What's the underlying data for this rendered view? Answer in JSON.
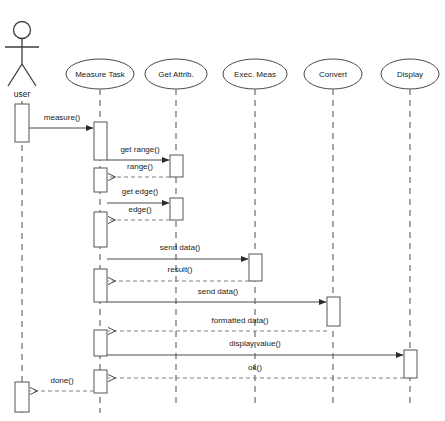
{
  "diagram": {
    "type": "uml-sequence-diagram",
    "title": "",
    "background_color": "#ffffff",
    "line_color": "#4a4a4a",
    "dash_color": "#808080",
    "actor": {
      "label": "user",
      "cx": 22,
      "head_cy": 30,
      "icon": "stick-figure-actor"
    },
    "lifelines": [
      {
        "id": "user",
        "label": "user",
        "x": 22,
        "shape": "actor",
        "head_cy": 30
      },
      {
        "id": "measure_task",
        "label": "Measure Task",
        "x": 100,
        "shape": "ellipse",
        "head_cy": 74
      },
      {
        "id": "get_attrib",
        "label": "Get Attrib.",
        "x": 176,
        "shape": "ellipse",
        "head_cy": 74
      },
      {
        "id": "exec_meas",
        "label": "Exec. Meas",
        "x": 255,
        "shape": "ellipse",
        "head_cy": 74
      },
      {
        "id": "convert",
        "label": "Convert",
        "x": 333,
        "shape": "ellipse",
        "head_cy": 74
      },
      {
        "id": "display",
        "label": "Display",
        "x": 410,
        "shape": "ellipse",
        "head_cy": 74
      }
    ],
    "activations": [
      {
        "lifeline": "user",
        "x": 22,
        "y": 104,
        "w": 14,
        "h": 38
      },
      {
        "lifeline": "user",
        "x": 22,
        "y": 382,
        "w": 14,
        "h": 30
      },
      {
        "lifeline": "measure_task",
        "x": 100,
        "y": 122,
        "w": 13,
        "h": 38
      },
      {
        "lifeline": "measure_task",
        "x": 100,
        "y": 168,
        "w": 13,
        "h": 24
      },
      {
        "lifeline": "measure_task",
        "x": 100,
        "y": 212,
        "w": 13,
        "h": 35
      },
      {
        "lifeline": "measure_task",
        "x": 100,
        "y": 269,
        "w": 13,
        "h": 33
      },
      {
        "lifeline": "measure_task",
        "x": 100,
        "y": 330,
        "w": 13,
        "h": 26
      },
      {
        "lifeline": "measure_task",
        "x": 100,
        "y": 370,
        "w": 13,
        "h": 23
      },
      {
        "lifeline": "get_attrib",
        "x": 176,
        "y": 155,
        "w": 13,
        "h": 22
      },
      {
        "lifeline": "get_attrib",
        "x": 176,
        "y": 198,
        "w": 13,
        "h": 22
      },
      {
        "lifeline": "exec_meas",
        "x": 255,
        "y": 254,
        "w": 13,
        "h": 27
      },
      {
        "lifeline": "convert",
        "x": 333,
        "y": 297,
        "w": 13,
        "h": 29
      },
      {
        "lifeline": "display",
        "x": 410,
        "y": 350,
        "w": 13,
        "h": 28
      }
    ],
    "messages": [
      {
        "index": 1,
        "label": "measure()",
        "from": "user",
        "to": "measure_task",
        "y": 128,
        "label_y": 118,
        "style": "solid",
        "direction": "right"
      },
      {
        "index": 2,
        "label": "get range()",
        "from": "measure_task",
        "to": "get_attrib",
        "y": 160,
        "label_y": 150,
        "style": "solid",
        "direction": "right"
      },
      {
        "index": 3,
        "label": "range()",
        "from": "get_attrib",
        "to": "measure_task",
        "y": 177,
        "label_y": 167,
        "style": "dashed",
        "direction": "left"
      },
      {
        "index": 4,
        "label": "get edge()",
        "from": "measure_task",
        "to": "get_attrib",
        "y": 203,
        "label_y": 192,
        "style": "solid",
        "direction": "right"
      },
      {
        "index": 5,
        "label": "edge()",
        "from": "get_attrib",
        "to": "measure_task",
        "y": 220,
        "label_y": 210,
        "style": "dashed",
        "direction": "left"
      },
      {
        "index": 6,
        "label": "send data()",
        "from": "measure_task",
        "to": "exec_meas",
        "y": 259,
        "label_y": 248,
        "style": "solid",
        "direction": "right"
      },
      {
        "index": 7,
        "label": "result()",
        "from": "exec_meas",
        "to": "measure_task",
        "y": 281,
        "label_y": 270,
        "style": "dashed",
        "direction": "left"
      },
      {
        "index": 8,
        "label": "send data()",
        "from": "measure_task",
        "to": "convert",
        "y": 302,
        "label_y": 292,
        "style": "solid",
        "direction": "right"
      },
      {
        "index": 9,
        "label": "formatted data()",
        "from": "convert",
        "to": "measure_task",
        "y": 331,
        "label_y": 321,
        "style": "dashed",
        "direction": "left"
      },
      {
        "index": 10,
        "label": "display value()",
        "from": "measure_task",
        "to": "display",
        "y": 355,
        "label_y": 344,
        "style": "solid",
        "direction": "right"
      },
      {
        "index": 11,
        "label": "ok()",
        "from": "display",
        "to": "measure_task",
        "y": 378,
        "label_y": 368,
        "style": "dashed",
        "direction": "left"
      },
      {
        "index": 12,
        "label": "done()",
        "from": "measure_task",
        "to": "user",
        "y": 391,
        "label_y": 381,
        "style": "dashed",
        "direction": "left"
      }
    ]
  }
}
